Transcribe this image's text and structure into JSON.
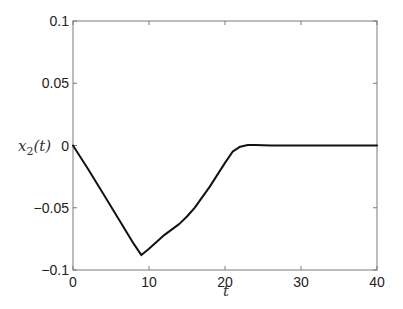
{
  "chart_data": {
    "type": "line",
    "title": "",
    "xlabel": "t",
    "ylabel": "x_2(t)",
    "ylabel_display": "x2(t)",
    "xlim": [
      0,
      40
    ],
    "ylim": [
      -0.1,
      0.1
    ],
    "xticks": [
      0,
      10,
      20,
      30,
      40
    ],
    "xtick_labels": [
      "0",
      "10",
      "20",
      "30",
      "40"
    ],
    "yticks": [
      -0.1,
      -0.05,
      0,
      0.05,
      0.1
    ],
    "ytick_labels": [
      "-0.1",
      "-0.05",
      "0",
      "0.05",
      "0.1"
    ],
    "grid": false,
    "legend": null,
    "series": [
      {
        "name": "x2(t)",
        "color": "#111111",
        "x": [
          0,
          2,
          4,
          6,
          8,
          9,
          10,
          12,
          14,
          15,
          16,
          18,
          20,
          21,
          22,
          23,
          24,
          26,
          30,
          35,
          40
        ],
        "y": [
          0,
          -0.019,
          -0.039,
          -0.059,
          -0.079,
          -0.088,
          -0.083,
          -0.072,
          -0.063,
          -0.057,
          -0.05,
          -0.033,
          -0.014,
          -0.005,
          -0.001,
          0.0004,
          0.0003,
          0.0001,
          0,
          0,
          0
        ]
      }
    ]
  }
}
